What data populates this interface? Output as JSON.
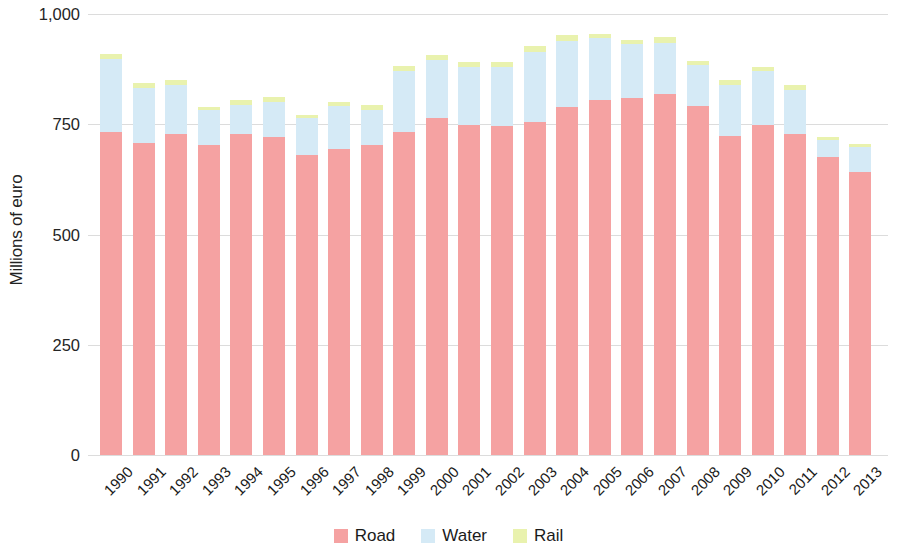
{
  "chart_data": {
    "type": "bar",
    "stacked": true,
    "title": "",
    "subtitle": "",
    "xlabel": "",
    "ylabel": "Millions of euro",
    "ylim": [
      0,
      1000
    ],
    "yticks": [
      0,
      250,
      500,
      750,
      1000
    ],
    "ytick_labels": [
      "0",
      "250",
      "500",
      "750",
      "1,000"
    ],
    "grid": true,
    "legend_position": "bottom",
    "categories": [
      "1990",
      "1991",
      "1992",
      "1993",
      "1994",
      "1995",
      "1996",
      "1997",
      "1998",
      "1999",
      "2000",
      "2001",
      "2002",
      "2003",
      "2004",
      "2005",
      "2006",
      "2007",
      "2008",
      "2009",
      "2010",
      "2011",
      "2012",
      "2013"
    ],
    "series": [
      {
        "name": "Road",
        "color": "#f5a2a2",
        "values": [
          733,
          708,
          727,
          704,
          728,
          722,
          681,
          693,
          702,
          733,
          764,
          748,
          747,
          755,
          790,
          805,
          809,
          818,
          792,
          723,
          748,
          728,
          676,
          641
        ]
      },
      {
        "name": "Water",
        "color": "#d5eaf6",
        "values": [
          164,
          124,
          113,
          78,
          66,
          79,
          83,
          98,
          80,
          138,
          132,
          132,
          133,
          160,
          149,
          140,
          122,
          117,
          92,
          115,
          122,
          100,
          38,
          57
        ]
      },
      {
        "name": "Rail",
        "color": "#e9f2ae",
        "values": [
          13,
          11,
          10,
          8,
          11,
          10,
          7,
          9,
          11,
          11,
          10,
          12,
          11,
          12,
          13,
          10,
          10,
          13,
          9,
          12,
          10,
          12,
          8,
          8
        ]
      }
    ],
    "totals": [
      910,
      843,
      850,
      790,
      805,
      811,
      771,
      800,
      793,
      882,
      906,
      892,
      891,
      927,
      952,
      955,
      941,
      948,
      893,
      850,
      880,
      840,
      722,
      706
    ]
  },
  "legend": {
    "items": [
      {
        "label": "Road",
        "color": "#f5a2a2"
      },
      {
        "label": "Water",
        "color": "#d5eaf6"
      },
      {
        "label": "Rail",
        "color": "#e9f2ae"
      }
    ]
  }
}
